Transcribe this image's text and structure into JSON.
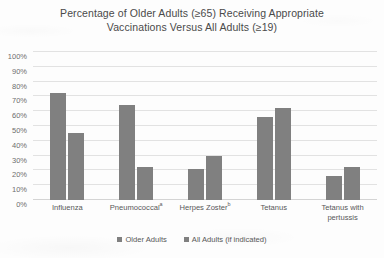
{
  "chart_data": {
    "type": "bar",
    "title": "Percentage of Older Adults (≥65) Receiving Appropriate Vaccinations Versus All Adults (≥19)",
    "title_lines": [
      "Percentage of Older Adults (≥65) Receiving Appropriate",
      "Vaccinations Versus All Adults (≥19)"
    ],
    "categories": [
      "Influenza",
      "Pneumococcal",
      "Herpes Zoster",
      "Tetanus",
      "Tetanus with pertussis"
    ],
    "category_footnotes": [
      "",
      "a",
      "b",
      "",
      ""
    ],
    "category_label_lines": [
      [
        "Influenza"
      ],
      [
        "Pneumococcal"
      ],
      [
        "Herpes Zoster"
      ],
      [
        "Tetanus"
      ],
      [
        "Tetanus with",
        "pertussis"
      ]
    ],
    "series": [
      {
        "name": "Older Adults",
        "values": [
          72,
          64,
          21,
          56,
          16
        ],
        "color": "#808080"
      },
      {
        "name": "All Adults (if indicated)",
        "values": [
          45,
          22,
          30,
          62,
          22
        ],
        "color": "#808080"
      }
    ],
    "xlabel": "",
    "ylabel": "",
    "ylim": [
      0,
      100
    ],
    "y_ticks": [
      0,
      10,
      20,
      30,
      40,
      50,
      60,
      70,
      80,
      90,
      100
    ],
    "y_tick_labels": [
      "0%",
      "10%",
      "20%",
      "30%",
      "40%",
      "50%",
      "60%",
      "70%",
      "80%",
      "90%",
      "100%"
    ],
    "grid": true,
    "legend_position": "bottom"
  },
  "legend": {
    "items": [
      {
        "label": "Older Adults"
      },
      {
        "label": "All Adults (if indicated)"
      }
    ]
  },
  "colors": {
    "bar": "#808080",
    "gridline": "#e2e2e2",
    "axis_text": "#6d6d6d",
    "title_text": "#4a4a4a",
    "background": "#fdfdfd"
  }
}
